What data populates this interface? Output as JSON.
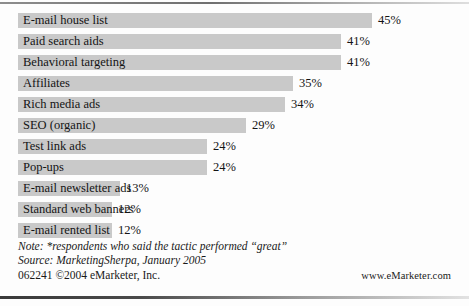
{
  "chart_data": {
    "type": "bar",
    "orientation": "horizontal",
    "title": "",
    "xlabel": "",
    "ylabel": "",
    "xlim": [
      0,
      50
    ],
    "grid": false,
    "legend": null,
    "value_suffix": "%",
    "categories": [
      "E-mail house list",
      "Paid search aids",
      "Behavioral targeting",
      "Affiliates",
      "Rich media ads",
      "SEO (organic)",
      "Test link ads",
      "Pop-ups",
      "E-mail newsletter ads",
      "Standard web banners",
      "E-mail rented list"
    ],
    "values": [
      45,
      41,
      41,
      35,
      34,
      29,
      24,
      24,
      13,
      12,
      12
    ],
    "value_labels": [
      "45%",
      "41%",
      "41%",
      "35%",
      "34%",
      "29%",
      "24%",
      "24%",
      "13%",
      "12%",
      "12%"
    ],
    "bar_color": "#c9c9c9"
  },
  "footer": {
    "note": "Note: *respondents who said the tactic performed “great”",
    "source": "Source: MarketingSherpa, January 2005",
    "credit": "062241  ©2004 eMarketer, Inc.",
    "url": "www.eMarketer.com"
  }
}
